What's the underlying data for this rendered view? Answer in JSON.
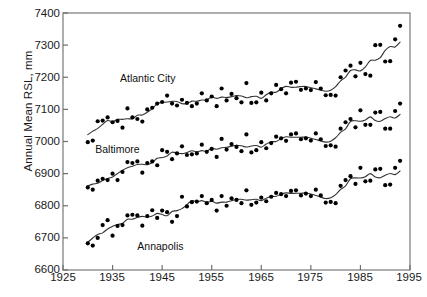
{
  "chart_data": {
    "type": "scatter",
    "title": "",
    "xlabel": "",
    "ylabel": "Annual Mean RSL, mm",
    "xlim": [
      1925,
      1995
    ],
    "ylim": [
      6600,
      7400
    ],
    "xticks": [
      1925,
      1935,
      1945,
      1955,
      1965,
      1975,
      1985,
      1995
    ],
    "yticks": [
      6600,
      6700,
      6800,
      6900,
      7000,
      7100,
      7200,
      7300,
      7400
    ],
    "grid": false,
    "legend": "inline-annotations",
    "marker": "filled-circle",
    "marker_color": "#000000",
    "line_color": "#333333",
    "annotations": [
      {
        "text": "Atlantic City",
        "x": 1936.5,
        "y": 7193
      },
      {
        "text": "Baltimore",
        "x": 1931.5,
        "y": 6975
      },
      {
        "text": "Annapolis",
        "x": 1940.0,
        "y": 6673
      }
    ],
    "series": [
      {
        "name": "Atlantic City",
        "x": [
          1930,
          1931,
          1932,
          1933,
          1934,
          1935,
          1936,
          1937,
          1938,
          1939,
          1940,
          1941,
          1942,
          1943,
          1944,
          1945,
          1946,
          1947,
          1948,
          1949,
          1950,
          1951,
          1952,
          1953,
          1954,
          1955,
          1956,
          1957,
          1958,
          1959,
          1960,
          1961,
          1962,
          1963,
          1964,
          1965,
          1966,
          1967,
          1968,
          1969,
          1970,
          1971,
          1972,
          1973,
          1974,
          1975,
          1976,
          1977,
          1978,
          1979,
          1980,
          1981,
          1982,
          1983,
          1984,
          1985,
          1986,
          1987,
          1988,
          1989,
          1990,
          1991,
          1992,
          1993
        ],
        "y": [
          6998,
          7003,
          7063,
          7065,
          7075,
          7060,
          7064,
          7043,
          7103,
          7075,
          7070,
          7062,
          7100,
          7105,
          7118,
          7123,
          7143,
          7118,
          7112,
          7130,
          7120,
          7110,
          7118,
          7150,
          7128,
          7140,
          7110,
          7165,
          7128,
          7148,
          7135,
          7122,
          7182,
          7120,
          7122,
          7152,
          7128,
          7150,
          7176,
          7163,
          7150,
          7183,
          7186,
          7161,
          7165,
          7160,
          7185,
          7165,
          7144,
          7145,
          7143,
          7200,
          7221,
          7236,
          7203,
          7245,
          7210,
          7205,
          7300,
          7301,
          7249,
          7250,
          7318,
          7360
        ]
      },
      {
        "name": "Baltimore",
        "x": [
          1930,
          1931,
          1932,
          1933,
          1934,
          1935,
          1936,
          1937,
          1938,
          1939,
          1940,
          1941,
          1942,
          1943,
          1944,
          1945,
          1946,
          1947,
          1948,
          1949,
          1950,
          1951,
          1952,
          1953,
          1954,
          1955,
          1956,
          1957,
          1958,
          1959,
          1960,
          1961,
          1962,
          1963,
          1964,
          1965,
          1966,
          1967,
          1968,
          1969,
          1970,
          1971,
          1972,
          1973,
          1974,
          1975,
          1976,
          1977,
          1978,
          1979,
          1980,
          1981,
          1982,
          1983,
          1984,
          1985,
          1986,
          1987,
          1988,
          1989,
          1990,
          1991,
          1992,
          1993
        ],
        "y": [
          6857,
          6850,
          6878,
          6884,
          6880,
          6900,
          6880,
          6905,
          6936,
          6933,
          6938,
          6903,
          6933,
          6938,
          6926,
          6973,
          6968,
          6945,
          6963,
          6985,
          6958,
          6960,
          6963,
          6990,
          6968,
          6977,
          6952,
          7008,
          6975,
          6992,
          6983,
          6970,
          7022,
          6966,
          6973,
          6998,
          6979,
          6995,
          7015,
          7010,
          7002,
          7022,
          7025,
          7007,
          7010,
          7003,
          7025,
          7007,
          6986,
          6988,
          6984,
          7040,
          7060,
          7070,
          7044,
          7097,
          7052,
          7052,
          7090,
          7092,
          7040,
          7040,
          7095,
          7118
        ]
      },
      {
        "name": "Annapolis",
        "x": [
          1930,
          1931,
          1932,
          1933,
          1934,
          1935,
          1936,
          1937,
          1938,
          1939,
          1940,
          1941,
          1942,
          1943,
          1944,
          1945,
          1946,
          1947,
          1948,
          1949,
          1950,
          1951,
          1952,
          1953,
          1954,
          1955,
          1956,
          1957,
          1958,
          1959,
          1960,
          1961,
          1962,
          1963,
          1964,
          1965,
          1966,
          1967,
          1968,
          1969,
          1970,
          1971,
          1972,
          1973,
          1974,
          1975,
          1976,
          1977,
          1978,
          1979,
          1980,
          1981,
          1982,
          1983,
          1984,
          1985,
          1986,
          1987,
          1988,
          1989,
          1990,
          1991,
          1992,
          1993
        ],
        "y": [
          6683,
          6676,
          6700,
          6740,
          6755,
          6707,
          6737,
          6740,
          6770,
          6772,
          6770,
          6738,
          6768,
          6786,
          6762,
          6785,
          6780,
          6750,
          6768,
          6828,
          6798,
          6811,
          6813,
          6830,
          6808,
          6818,
          6785,
          6830,
          6800,
          6823,
          6818,
          6808,
          6848,
          6803,
          6810,
          6825,
          6814,
          6828,
          6840,
          6836,
          6830,
          6846,
          6848,
          6832,
          6838,
          6830,
          6850,
          6832,
          6810,
          6812,
          6808,
          6862,
          6880,
          6892,
          6868,
          6918,
          6876,
          6878,
          6913,
          6915,
          6864,
          6866,
          6918,
          6940
        ]
      }
    ]
  },
  "axes": {
    "ylabel_text": "Annual Mean RSL, mm",
    "ytick_labels": [
      "7400",
      "7300",
      "7200",
      "7100",
      "7000",
      "6900",
      "6800",
      "6700",
      "6600"
    ],
    "xtick_labels": [
      "1925",
      "1935",
      "1945",
      "1955",
      "1965",
      "1975",
      "1985",
      "1995"
    ]
  },
  "labels": {
    "atlantic_city": "Atlantic City",
    "baltimore": "Baltimore",
    "annapolis": "Annapolis"
  }
}
